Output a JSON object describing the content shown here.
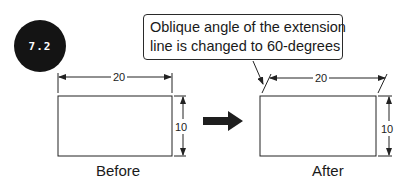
{
  "figure_label": "7.2",
  "callout": {
    "line1": "Oblique angle of the extension",
    "line2": "line is changed to 60-degrees"
  },
  "before": {
    "caption": "Before",
    "width_dim": "20",
    "height_dim": "10"
  },
  "after": {
    "caption": "After",
    "width_dim": "20",
    "height_dim": "10",
    "extension_oblique_angle_deg": 60
  },
  "transition_arrow": "right-arrow",
  "colors": {
    "badge_bg": "#141414",
    "badge_text": "#ffffff",
    "lines": "#222222",
    "arrow_fill": "#1e1e1e"
  }
}
